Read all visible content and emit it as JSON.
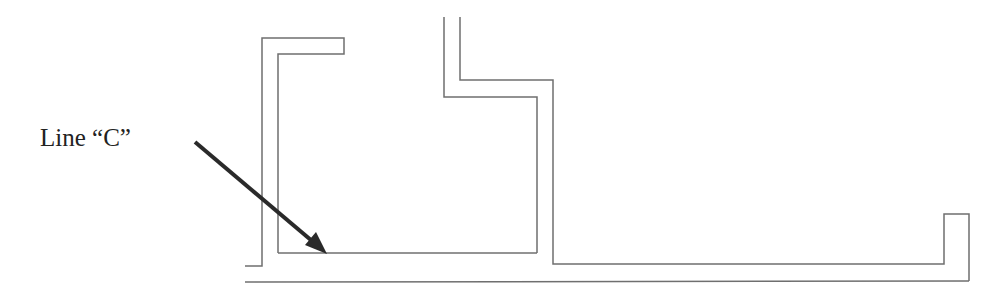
{
  "diagram": {
    "label": "Line “C”",
    "colors": {
      "outline": "#6f6f6f",
      "arrow": "#2a2a2a",
      "text": "#222222",
      "background": "#ffffff"
    },
    "arrow": {
      "from": [
        195,
        142
      ],
      "to": [
        327,
        254
      ],
      "points_to": "Line C (inner horizontal line at bottom of left chamber)"
    },
    "paths": [
      {
        "name": "left-bracket-outer",
        "points": "245,266 262,266 262,38 344,38 344,54 278,54 278,253"
      },
      {
        "name": "line-c",
        "points": "278,253 537,253"
      },
      {
        "name": "upper-middle-left",
        "points": "444,17 444,97 537,97 537,253"
      },
      {
        "name": "upper-middle-right",
        "points": "460,17 460,80 553,80 553,264 944,264 944,214 969,214 969,281"
      },
      {
        "name": "bottom-outer-line",
        "points": "245,282 969,281"
      }
    ]
  }
}
